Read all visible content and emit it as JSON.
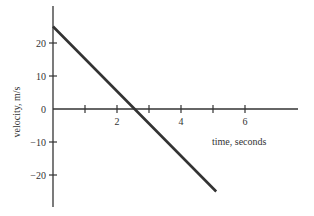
{
  "chart_data": {
    "type": "line",
    "title": "",
    "xlabel": "time, seconds",
    "ylabel": "velocity, m/s",
    "xlim": [
      0,
      7
    ],
    "ylim": [
      -30,
      30
    ],
    "grid": false,
    "legend": null,
    "x_ticks": [
      1,
      2,
      3,
      4,
      5,
      6
    ],
    "x_tick_labels": [
      "",
      "2",
      "",
      "4",
      "",
      "6"
    ],
    "y_ticks": [
      20,
      10,
      0,
      -10,
      -20
    ],
    "y_tick_labels": [
      "20",
      "10",
      "0",
      "−10",
      "−20"
    ],
    "series": [
      {
        "name": "velocity",
        "color": "#333333",
        "x": [
          0,
          2.55,
          5.1
        ],
        "y": [
          25,
          0,
          -25
        ]
      }
    ]
  },
  "axis": {
    "x_label": "time, seconds",
    "y_label": "velocity, m/s"
  },
  "colors": {
    "axis": "#333333",
    "line": "#333333"
  }
}
